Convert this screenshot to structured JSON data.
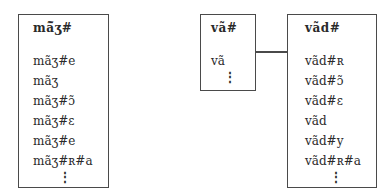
{
  "tables": [
    {
      "name": "left",
      "title": "mã̃ʒ#",
      "items": [
        "mãʒ#e",
        "mãʒ",
        "mãʒ#ɔ̃",
        "mãʒ#ɛ",
        "mãʒ#e",
        "mãʒ#ʀ#a"
      ],
      "ellipsis": "⋮"
    },
    {
      "name": "middle",
      "title": "vã#",
      "items": [
        "vã"
      ],
      "ellipsis": "⋮"
    },
    {
      "name": "right",
      "title": "vãd#",
      "items": [
        "vãd#ʀ",
        "vãd#ɔ̃",
        "vãd#ɛ",
        "vãd",
        "vãd#y",
        "vãd#ʀ#a"
      ],
      "ellipsis": "⋮"
    }
  ],
  "connector": {
    "from": "middle",
    "to": "right"
  }
}
